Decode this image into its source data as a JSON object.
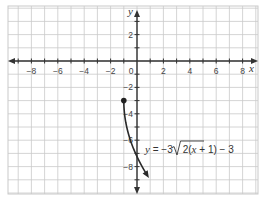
{
  "chart_data": {
    "type": "line",
    "title": "",
    "xlabel": "x",
    "ylabel": "y",
    "xlim": [
      -9.7,
      9.3
    ],
    "ylim": [
      -10,
      4.2
    ],
    "grid": true,
    "x_ticks": [
      -8,
      -6,
      -4,
      -2,
      0,
      2,
      4,
      6,
      8
    ],
    "x_tick_labels": [
      "−8",
      "−6",
      "−4",
      "−2",
      "0",
      "2",
      "4",
      "6",
      "8"
    ],
    "y_ticks": [
      2,
      -2,
      -4,
      -6,
      -8
    ],
    "y_tick_labels": [
      "2",
      "−2",
      "−4",
      "−6",
      "−8"
    ],
    "series": [
      {
        "name": "y = −3√(2(x + 1)) − 3",
        "function": "y = -3*sqrt(2*(x+1)) - 3",
        "start_point": {
          "x": -1,
          "y": -3,
          "closed": true
        },
        "x": [
          -1,
          -0.875,
          -0.5,
          0,
          0.5,
          0.875
        ],
        "y": [
          -3,
          -4.5,
          -5.6,
          -7.24,
          -8.2,
          -8.81
        ]
      }
    ],
    "annotations": [
      {
        "text": "y = −3√2(x + 1) − 3",
        "x": 0.7,
        "y": -6.2
      }
    ]
  },
  "labels": {
    "x_axis": "x",
    "y_axis": "y",
    "eq_y": "y",
    "eq_mid": " = −3",
    "eq_rad": "2(",
    "eq_x": "x",
    "eq_tail": " + 1)",
    "eq_end": " − 3"
  },
  "colors": {
    "grid": "#c9c9c9",
    "axis": "#333333",
    "curve": "#2a2a2a",
    "background": "#ffffff"
  }
}
